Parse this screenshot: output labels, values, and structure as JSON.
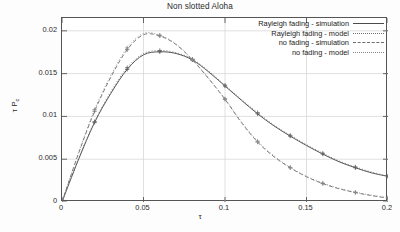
{
  "chart_data": {
    "type": "line",
    "title": "Non slotted Aloha",
    "xlabel": "τ",
    "ylabel_tex": "τ P",
    "ylabel_sub": "c",
    "xlim": [
      0,
      0.2
    ],
    "ylim": [
      0,
      0.0215
    ],
    "grid": true,
    "xticks": [
      "0",
      "0.05",
      "0.1",
      "0.15",
      "0.2"
    ],
    "xtick_values": [
      0,
      0.05,
      0.1,
      0.15,
      0.2
    ],
    "yticks": [
      "0",
      "0.005",
      "0.01",
      "0.015",
      "0.02"
    ],
    "ytick_values": [
      0,
      0.005,
      0.01,
      0.015,
      0.02
    ],
    "legend_position": "top-right",
    "series": [
      {
        "name": "Rayleigh fading - simulation",
        "style": "solid",
        "marker": "plus",
        "color": "#4b4b4b",
        "x": [
          0,
          0.01,
          0.02,
          0.03,
          0.04,
          0.05,
          0.06,
          0.07,
          0.08,
          0.09,
          0.1,
          0.11,
          0.12,
          0.13,
          0.14,
          0.15,
          0.16,
          0.17,
          0.18,
          0.19,
          0.2
        ],
        "y": [
          0,
          0.0049,
          0.0093,
          0.0127,
          0.0155,
          0.0172,
          0.01755,
          0.01735,
          0.0166,
          0.0152,
          0.01355,
          0.0119,
          0.0103,
          0.0089,
          0.0077,
          0.0066,
          0.0056,
          0.0047,
          0.004,
          0.0034,
          0.003
        ]
      },
      {
        "name": "Rayleigh fading - model",
        "style": "dotted",
        "marker": "plus",
        "color": "#6d6d6d",
        "x": [
          0,
          0.01,
          0.02,
          0.03,
          0.04,
          0.05,
          0.06,
          0.07,
          0.08,
          0.09,
          0.1,
          0.11,
          0.12,
          0.13,
          0.14,
          0.15,
          0.16,
          0.17,
          0.18,
          0.19,
          0.2
        ],
        "y": [
          0,
          0.005,
          0.0094,
          0.0129,
          0.0157,
          0.01735,
          0.0177,
          0.01745,
          0.0167,
          0.0153,
          0.01365,
          0.012,
          0.01045,
          0.009,
          0.0078,
          0.0067,
          0.0057,
          0.0048,
          0.0041,
          0.0035,
          0.003
        ]
      },
      {
        "name": "no fading - simulation",
        "style": "dashed",
        "marker": "plus",
        "color": "#6d6d6d",
        "x": [
          0,
          0.01,
          0.02,
          0.03,
          0.04,
          0.05,
          0.06,
          0.07,
          0.08,
          0.09,
          0.1,
          0.11,
          0.12,
          0.13,
          0.14,
          0.15,
          0.16,
          0.17,
          0.18,
          0.19,
          0.2
        ],
        "y": [
          0,
          0.0056,
          0.0106,
          0.0146,
          0.0178,
          0.01955,
          0.0194,
          0.0184,
          0.0166,
          0.0144,
          0.012,
          0.0093,
          0.007,
          0.0053,
          0.004,
          0.00295,
          0.00215,
          0.00155,
          0.0011,
          0.00075,
          0.00045
        ]
      },
      {
        "name": "no fading - model",
        "style": "dotted",
        "marker": "plus",
        "color": "#8a8a8a",
        "x": [
          0,
          0.01,
          0.02,
          0.03,
          0.04,
          0.05,
          0.06,
          0.07,
          0.08,
          0.09,
          0.1,
          0.11,
          0.12,
          0.13,
          0.14,
          0.15,
          0.16,
          0.17,
          0.18,
          0.19,
          0.2
        ],
        "y": [
          0,
          0.0057,
          0.0108,
          0.0148,
          0.018,
          0.0197,
          0.0195,
          0.01845,
          0.01665,
          0.01445,
          0.01205,
          0.0094,
          0.0071,
          0.0054,
          0.00405,
          0.003,
          0.0022,
          0.0016,
          0.00115,
          0.0008,
          0.0005
        ]
      }
    ]
  }
}
